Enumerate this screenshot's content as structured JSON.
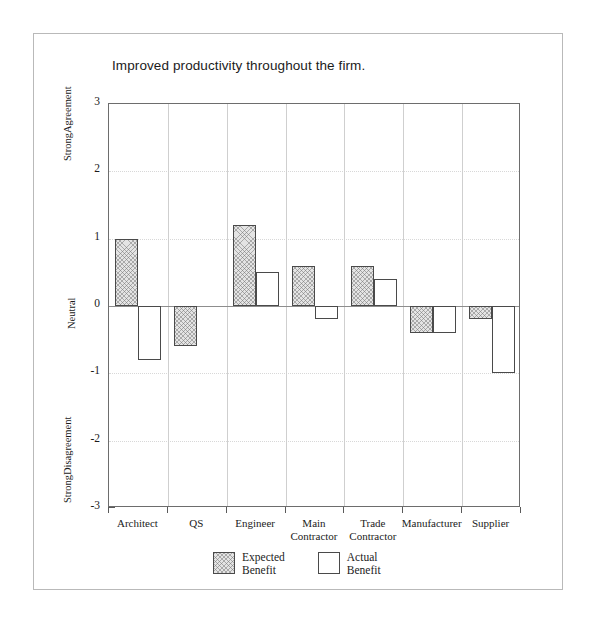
{
  "page": {
    "background_color": "#ffffff",
    "frame_color": "#b9b9b9"
  },
  "chart_data": {
    "type": "bar",
    "title": "Improved productivity throughout the firm.",
    "xlabel": "",
    "ylabel": "",
    "ylim": [
      -3,
      3
    ],
    "ytick_values": [
      3,
      2,
      1,
      0,
      -1,
      -2,
      -3
    ],
    "ytick_labels": [
      "3",
      "2",
      "1",
      "0",
      "-1",
      "-2",
      "-3"
    ],
    "yminor_step": 0.5,
    "grid": true,
    "grid_axis": "y",
    "legend_position": "bottom-center",
    "axis_annotations": {
      "top": "Strong\nAgreement",
      "middle": "Neutral",
      "bottom": "Strong\nDisagreement"
    },
    "categories": [
      "Architect",
      "QS",
      "Engineer",
      "Main\nContractor",
      "Trade\nContractor",
      "Manufacturer",
      "Supplier"
    ],
    "series": [
      {
        "name": "Expected\nBenefit",
        "fill": "hatched",
        "color": "#e4e4e4",
        "edge_color": "#4a4a4a",
        "values": [
          1.0,
          -0.6,
          1.2,
          0.6,
          0.6,
          -0.4,
          -0.2
        ]
      },
      {
        "name": "Actual\nBenefit",
        "fill": "white",
        "color": "#ffffff",
        "edge_color": "#4a4a4a",
        "values": [
          -0.8,
          null,
          0.5,
          -0.2,
          0.4,
          -0.4,
          -1.0
        ]
      }
    ]
  },
  "legend": {
    "entries": [
      {
        "label": "Expected\nBenefit",
        "style": "expected"
      },
      {
        "label": "Actual\nBenefit",
        "style": "actual"
      }
    ]
  }
}
